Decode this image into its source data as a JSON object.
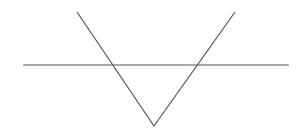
{
  "diagram": {
    "width": 305,
    "height": 129,
    "background": "#ffffff",
    "stroke_color": "#555555",
    "stroke_width": 1.2,
    "horizontal_line": {
      "x1": 23,
      "y1": 65,
      "x2": 289,
      "y2": 65
    },
    "v_shape": {
      "left_top": {
        "x": 77,
        "y": 12
      },
      "vertex": {
        "x": 154,
        "y": 126
      },
      "right_top": {
        "x": 235,
        "y": 12
      }
    }
  }
}
